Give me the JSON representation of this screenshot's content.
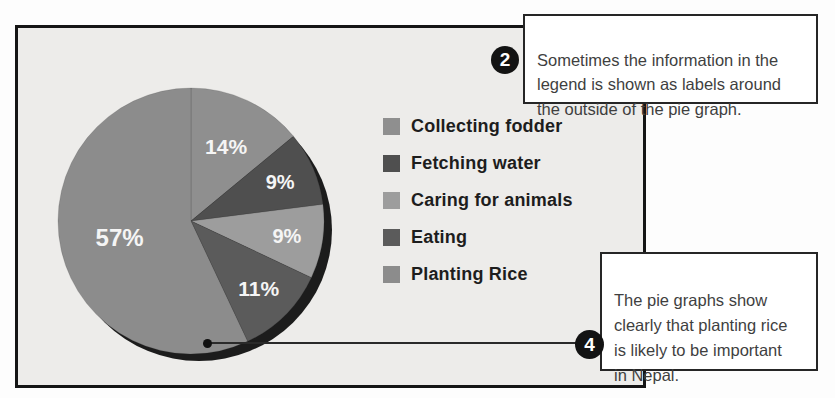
{
  "panel": {
    "background": "#edecea",
    "border_color": "#151515"
  },
  "chart_data": {
    "type": "pie",
    "labels": [
      "Collecting fodder",
      "Fetching water",
      "Caring for animals",
      "Eating",
      "Planting Rice"
    ],
    "values": [
      14,
      9,
      9,
      11,
      57
    ],
    "slice_labels": [
      "14%",
      "9%",
      "9%",
      "11%",
      "57%"
    ],
    "colors": [
      "#8f8f8f",
      "#4f4f4f",
      "#9d9d9d",
      "#5b5b5b",
      "#8c8c8c"
    ],
    "slice_label_color": "#f5f5f5",
    "shadow_color": "#1c1c1c",
    "start_angle_deg": 0,
    "direction": "clockwise",
    "legend_position": "right",
    "label_radius": [
      0.62,
      0.73,
      0.73,
      0.72,
      0.55
    ],
    "label_size": [
      21,
      20,
      20,
      21,
      24
    ]
  },
  "callouts": {
    "step2": {
      "badge": "2",
      "text": "Sometimes the information in the\nlegend is shown as labels around\nthe outside of the pie graph."
    },
    "step4": {
      "badge": "4",
      "text": "The pie graphs show\nclearly that planting rice\nis likely to be important\nin Nepal."
    }
  }
}
